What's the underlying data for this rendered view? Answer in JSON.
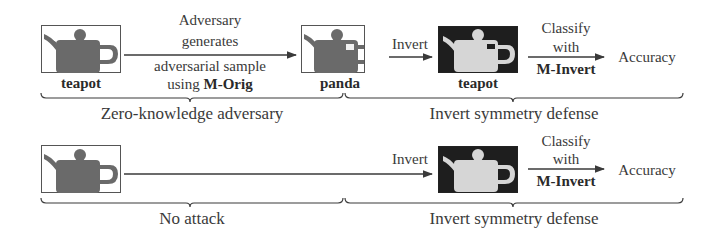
{
  "diagram": {
    "row1": {
      "source_image": {
        "label": "teapot",
        "style": "original grayscale teapot"
      },
      "attack_arrow_text": [
        "Adversary",
        "generates",
        "adversarial sample"
      ],
      "attack_arrow_text_last_prefix": "using ",
      "attack_model": "M-Orig",
      "adversarial_image": {
        "label": "panda",
        "style": "perturbed teapot"
      },
      "invert_label": "Invert",
      "inverted_image": {
        "label": "teapot",
        "style": "color-inverted teapot"
      },
      "classify_text": [
        "Classify",
        "with"
      ],
      "classify_model": "M-Invert",
      "result": "Accuracy",
      "left_brace_caption": "Zero-knowledge adversary",
      "right_brace_caption": "Invert symmetry defense"
    },
    "row2": {
      "source_image": {
        "style": "original grayscale teapot"
      },
      "invert_label": "Invert",
      "inverted_image": {
        "style": "color-inverted teapot"
      },
      "classify_text": [
        "Classify",
        "with"
      ],
      "classify_model": "M-Invert",
      "result": "Accuracy",
      "left_brace_caption": "No attack",
      "right_brace_caption": "Invert symmetry defense"
    },
    "colors": {
      "line": "#3a3a3a",
      "teapot_dark": "#6a6a6a",
      "teapot_light": "#d6d6d6",
      "inverted_bg": "#1e1e1e"
    }
  }
}
